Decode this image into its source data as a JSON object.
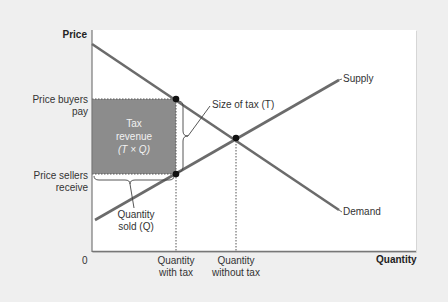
{
  "axes": {
    "y_label": "Price",
    "x_label": "Quantity",
    "origin_label": "0"
  },
  "price_labels": {
    "buyers_line1": "Price buyers",
    "buyers_line2": "pay",
    "sellers_line1": "Price sellers",
    "sellers_line2": "receive"
  },
  "quantity_labels": {
    "with_tax_line1": "Quantity",
    "with_tax_line2": "with tax",
    "without_tax_line1": "Quantity",
    "without_tax_line2": "without tax"
  },
  "curves": {
    "supply": "Supply",
    "demand": "Demand"
  },
  "annotations": {
    "tax_revenue_line1": "Tax",
    "tax_revenue_line2": "revenue",
    "tax_revenue_line3": "(T × Q)",
    "size_of_tax": "Size of tax (T)",
    "quantity_sold_line1": "Quantity",
    "quantity_sold_line2": "sold (Q)"
  },
  "colors": {
    "background": "#efefef",
    "plot": "#ffffff",
    "curve": "#6b6b6b",
    "tax_area": "#8c8c8c",
    "point": "#111111"
  }
}
